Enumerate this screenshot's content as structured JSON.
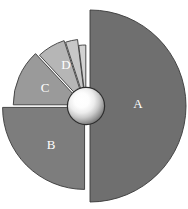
{
  "chart_data": {
    "type": "pie",
    "title": "",
    "subtitle": "",
    "xlabel": "",
    "ylabel": "",
    "grid": false,
    "legend_position": "none",
    "exploded": true,
    "center_ornament": "3d-sphere",
    "background_color": "#ffffff",
    "outline_color": "#3a3a3a",
    "label_color": "#ffffff",
    "categories": [
      "A",
      "B",
      "C",
      "D",
      "E",
      "F"
    ],
    "values": [
      50,
      25,
      13,
      7,
      3,
      2
    ],
    "labels_shown": [
      "A",
      "B",
      "C",
      "D"
    ],
    "series": [
      {
        "name": "Series 1",
        "values": [
          50,
          25,
          13,
          7,
          3,
          2
        ]
      }
    ],
    "slices": [
      {
        "label": "A",
        "value": 50,
        "percent": "50%",
        "color": "#6f6f6f",
        "start_angle": -90,
        "end_angle": 90,
        "radius": 96,
        "explode": 4,
        "label_visible": true,
        "label_x": 138,
        "label_y": 105
      },
      {
        "label": "B",
        "value": 25,
        "percent": "25%",
        "color": "#7d7d7d",
        "start_angle": 90,
        "end_angle": 180,
        "radius": 82,
        "explode": 2,
        "label_visible": true,
        "label_x": 51,
        "label_y": 146
      },
      {
        "label": "C",
        "value": 13,
        "percent": "13%",
        "color": "#9a9a9a",
        "start_angle": 180,
        "end_angle": 227,
        "radius": 70,
        "explode": 3,
        "label_visible": true,
        "label_x": 45,
        "label_y": 89
      },
      {
        "label": "D",
        "value": 7,
        "percent": "7%",
        "color": "#b6b6b6",
        "start_angle": 227,
        "end_angle": 252,
        "radius": 66,
        "explode": 3,
        "label_visible": true,
        "label_x": 66,
        "label_y": 66
      },
      {
        "label": "E",
        "value": 3,
        "percent": "3%",
        "color": "#c7c7c7",
        "start_angle": 252,
        "end_angle": 263,
        "radius": 64,
        "explode": 3,
        "label_visible": false,
        "label_x": 80,
        "label_y": 56
      },
      {
        "label": "F",
        "value": 2,
        "percent": "2%",
        "color": "#d2d2d2",
        "start_angle": 263,
        "end_angle": 270,
        "radius": 58,
        "explode": 3,
        "label_visible": false,
        "label_x": 86,
        "label_y": 58
      }
    ],
    "center": {
      "x": 86,
      "y": 106,
      "radius": 18,
      "highlight_color": "#ffffff",
      "shade_color": "#7a7a7a",
      "ring_color": "#2e2e2e"
    }
  }
}
